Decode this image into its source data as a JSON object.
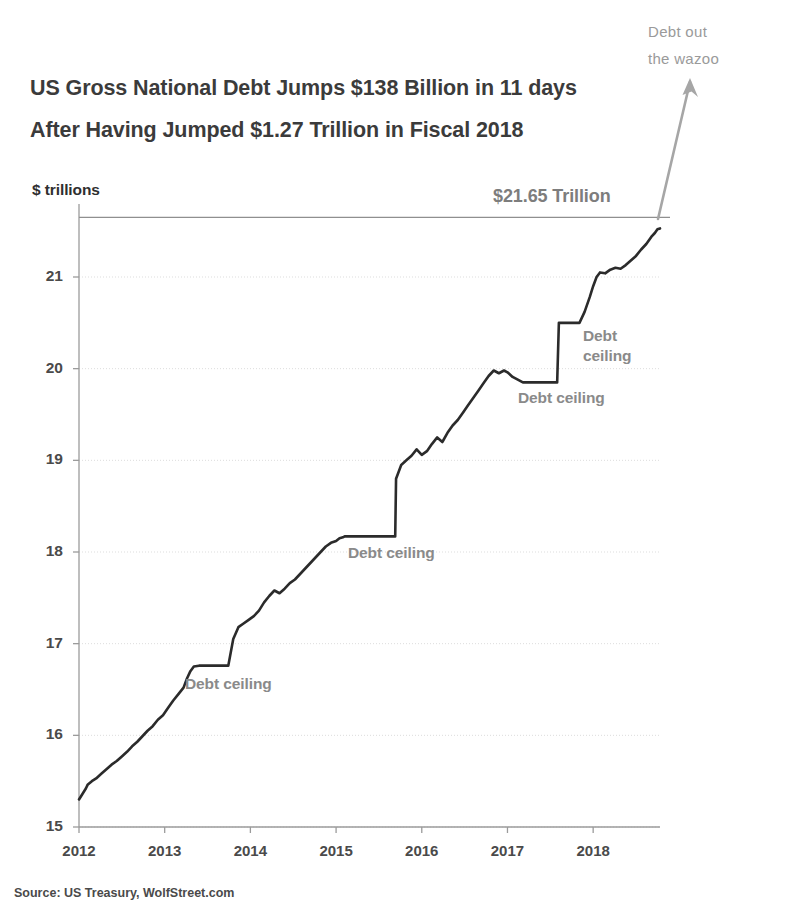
{
  "title": {
    "line1": "US Gross National Debt Jumps $138 Billion in 11 days",
    "line2": "After Having Jumped $1.27 Trillion in Fiscal 2018"
  },
  "axis_unit_label": "$ trillions",
  "callout": {
    "wazoo_line1": "Debt out",
    "wazoo_line2": "the wazoo"
  },
  "source_note": "Source: US Treasury, WolfStreet.com",
  "colors": {
    "line": "#2b2b2b",
    "annotation": "#8a8a8a",
    "arrow": "#a6a6a6",
    "grid": "#dddddd",
    "axis": "#9b9b9b",
    "title": "#3b3b3b"
  },
  "chart_data": {
    "type": "line",
    "title": "US Gross National Debt Jumps $138 Billion in 11 days After Having Jumped $1.27 Trillion in Fiscal 2018",
    "xlabel": "",
    "ylabel": "$ trillions",
    "ylim": [
      15,
      21.8
    ],
    "xlim": [
      2012.0,
      2018.78
    ],
    "yticks": [
      15,
      16,
      17,
      18,
      19,
      20,
      21
    ],
    "ytick_labels": [
      "15",
      "16",
      "17",
      "18",
      "19",
      "20",
      "21"
    ],
    "xticks": [
      2012,
      2013,
      2014,
      2015,
      2016,
      2017,
      2018
    ],
    "xtick_labels": [
      "2012",
      "2013",
      "2014",
      "2015",
      "2016",
      "2017",
      "2018"
    ],
    "grid": true,
    "legend": "none",
    "reference_line": {
      "value": 21.65,
      "label": "$21.65 Trillion"
    },
    "series": [
      {
        "name": "US Gross National Debt",
        "color": "#2b2b2b",
        "x": [
          2012.0,
          2012.04,
          2012.08,
          2012.1,
          2012.15,
          2012.2,
          2012.26,
          2012.32,
          2012.38,
          2012.44,
          2012.5,
          2012.56,
          2012.62,
          2012.68,
          2012.74,
          2012.8,
          2012.86,
          2012.92,
          2012.98,
          2013.04,
          2013.1,
          2013.16,
          2013.22,
          2013.26,
          2013.3,
          2013.34,
          2013.4,
          2013.46,
          2013.52,
          2013.58,
          2013.64,
          2013.7,
          2013.74,
          2013.742,
          2013.8,
          2013.86,
          2013.92,
          2013.98,
          2014.04,
          2014.1,
          2014.16,
          2014.22,
          2014.28,
          2014.34,
          2014.4,
          2014.46,
          2014.52,
          2014.58,
          2014.64,
          2014.7,
          2014.76,
          2014.82,
          2014.88,
          2014.94,
          2015.0,
          2015.04,
          2015.08,
          2015.1,
          2015.16,
          2015.22,
          2015.3,
          2015.4,
          2015.5,
          2015.6,
          2015.69,
          2015.7,
          2015.76,
          2015.82,
          2015.88,
          2015.94,
          2016.0,
          2016.06,
          2016.12,
          2016.18,
          2016.24,
          2016.3,
          2016.36,
          2016.42,
          2016.48,
          2016.54,
          2016.6,
          2016.66,
          2016.72,
          2016.78,
          2016.84,
          2016.9,
          2016.96,
          2017.0,
          2017.06,
          2017.12,
          2017.18,
          2017.24,
          2017.3,
          2017.36,
          2017.42,
          2017.48,
          2017.54,
          2017.58,
          2017.6,
          2017.66,
          2017.72,
          2017.78,
          2017.84,
          2017.9,
          2017.96,
          2018.0,
          2018.04,
          2018.08,
          2018.14,
          2018.2,
          2018.26,
          2018.32,
          2018.38,
          2018.44,
          2018.5,
          2018.56,
          2018.62,
          2018.68,
          2018.72,
          2018.75,
          2018.78
        ],
        "y": [
          15.3,
          15.36,
          15.42,
          15.46,
          15.5,
          15.53,
          15.58,
          15.63,
          15.68,
          15.72,
          15.77,
          15.82,
          15.88,
          15.93,
          15.99,
          16.05,
          16.1,
          16.17,
          16.22,
          16.3,
          16.38,
          16.45,
          16.52,
          16.62,
          16.7,
          16.75,
          16.76,
          16.76,
          16.76,
          16.76,
          16.76,
          16.76,
          16.76,
          16.76,
          17.05,
          17.18,
          17.22,
          17.26,
          17.3,
          17.36,
          17.45,
          17.52,
          17.58,
          17.55,
          17.6,
          17.66,
          17.7,
          17.76,
          17.82,
          17.88,
          17.94,
          18.0,
          18.06,
          18.1,
          18.12,
          18.15,
          18.16,
          18.17,
          18.17,
          18.17,
          18.17,
          18.17,
          18.17,
          18.17,
          18.17,
          18.8,
          18.95,
          19.0,
          19.05,
          19.12,
          19.06,
          19.1,
          19.18,
          19.25,
          19.2,
          19.3,
          19.38,
          19.44,
          19.52,
          19.6,
          19.68,
          19.76,
          19.84,
          19.92,
          19.98,
          19.95,
          19.98,
          19.96,
          19.91,
          19.88,
          19.85,
          19.85,
          19.85,
          19.85,
          19.85,
          19.85,
          19.85,
          19.85,
          20.5,
          20.5,
          20.5,
          20.5,
          20.5,
          20.62,
          20.78,
          20.9,
          21.0,
          21.05,
          21.04,
          21.08,
          21.1,
          21.09,
          21.13,
          21.18,
          21.23,
          21.3,
          21.36,
          21.44,
          21.48,
          21.52,
          21.53
        ]
      }
    ],
    "annotations": [
      {
        "text": "Debt ceiling",
        "x_px": 185,
        "y_px": 674,
        "style": "single"
      },
      {
        "text": "Debt ceiling",
        "x_px": 348,
        "y_px": 543,
        "style": "single"
      },
      {
        "text": "Debt ceiling",
        "x_px": 518,
        "y_px": 388,
        "style": "single"
      },
      {
        "text": "Debt ceiling",
        "x_px": 583,
        "y_px": 326,
        "style": "two-line"
      },
      {
        "text": "$21.65 Trillion",
        "x_px": 493,
        "y_px": 186,
        "style": "reference"
      }
    ]
  }
}
